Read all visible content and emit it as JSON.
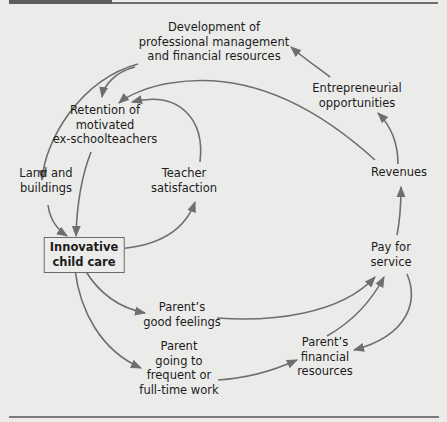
{
  "diagram": {
    "accent_color": "#6e6e6e",
    "nodes": {
      "development": {
        "lines": [
          "Development of",
          "professional management",
          "and financial resources"
        ]
      },
      "entrepreneurial": {
        "lines": [
          "Entrepreneurial",
          "opportunities"
        ]
      },
      "retention": {
        "lines": [
          "Retention of",
          "motivated",
          "ex-schoolteachers"
        ]
      },
      "land": {
        "lines": [
          "Land and",
          "buildings"
        ]
      },
      "teacher_satisfaction": {
        "lines": [
          "Teacher",
          "satisfaction"
        ]
      },
      "revenues": {
        "lines": [
          "Revenues"
        ]
      },
      "innovative_child_care": {
        "lines": [
          "Innovative",
          "child care"
        ],
        "highlighted": true
      },
      "pay_for_service": {
        "lines": [
          "Pay for",
          "service"
        ]
      },
      "parents_good_feelings": {
        "lines": [
          "Parent’s",
          "good feelings"
        ]
      },
      "parent_going_to_work": {
        "lines": [
          "Parent",
          "going to",
          "frequent or",
          "full-time work"
        ]
      },
      "parents_financial_resources": {
        "lines": [
          "Parent’s",
          "financial",
          "resources"
        ]
      }
    },
    "edges": [
      {
        "from": "development",
        "to": "retention"
      },
      {
        "from": "development",
        "to": "land"
      },
      {
        "from": "entrepreneurial",
        "to": "development"
      },
      {
        "from": "revenues",
        "to": "entrepreneurial"
      },
      {
        "from": "revenues",
        "to": "retention"
      },
      {
        "from": "teacher_satisfaction",
        "to": "retention"
      },
      {
        "from": "retention",
        "to": "innovative_child_care"
      },
      {
        "from": "land",
        "to": "innovative_child_care"
      },
      {
        "from": "innovative_child_care",
        "to": "teacher_satisfaction"
      },
      {
        "from": "innovative_child_care",
        "to": "parents_good_feelings"
      },
      {
        "from": "innovative_child_care",
        "to": "parent_going_to_work"
      },
      {
        "from": "parents_good_feelings",
        "to": "pay_for_service"
      },
      {
        "from": "parent_going_to_work",
        "to": "parents_financial_resources"
      },
      {
        "from": "parents_financial_resources",
        "to": "pay_for_service"
      },
      {
        "from": "pay_for_service",
        "to": "parents_financial_resources"
      },
      {
        "from": "pay_for_service",
        "to": "revenues"
      }
    ]
  }
}
